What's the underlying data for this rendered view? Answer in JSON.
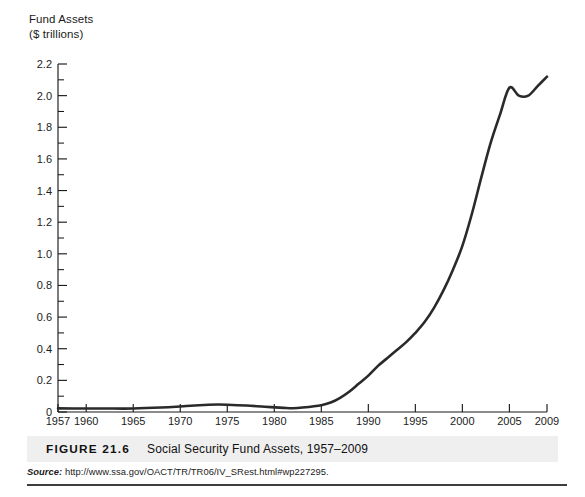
{
  "figure": {
    "number": "FIGURE 21.6",
    "title": "Social Security Fund Assets, 1957–2009",
    "source_label": "Source:",
    "source_url": "http://www.ssa.gov/OACT/TR/TR06/IV_SRest.html#wp227295."
  },
  "axis_title": "Fund Assets\n($ trillions)",
  "chart_data": {
    "type": "line",
    "title": "Social Security Fund Assets, 1957–2009",
    "xlabel": "",
    "ylabel": "Fund Assets ($ trillions)",
    "xlim": [
      1957,
      2009
    ],
    "ylim": [
      0,
      2.2
    ],
    "grid": false,
    "legend": "none",
    "x_tick_labels": [
      "1957",
      "1960",
      "1965",
      "1970",
      "1975",
      "1980",
      "1985",
      "1990",
      "1995",
      "2000",
      "2005",
      "2009"
    ],
    "x_ticks": [
      1957,
      1960,
      1965,
      1970,
      1975,
      1980,
      1985,
      1990,
      1995,
      2000,
      2005,
      2009
    ],
    "y_tick_labels": [
      "0",
      "0.2",
      "0.4",
      "0.6",
      "0.8",
      "1.0",
      "1.2",
      "1.4",
      "1.6",
      "1.8",
      "2.0",
      "2.2"
    ],
    "y_ticks": [
      0,
      0.2,
      0.4,
      0.6,
      0.8,
      1.0,
      1.2,
      1.4,
      1.6,
      1.8,
      2.0,
      2.2
    ],
    "y_minor_ticks": [
      0.1,
      0.3,
      0.5,
      0.7,
      0.9,
      1.1,
      1.3,
      1.5,
      1.7,
      1.9,
      2.1
    ],
    "series": [
      {
        "name": "Social Security Fund Assets",
        "color": "#2a2a2a",
        "x": [
          1957,
          1960,
          1962,
          1965,
          1968,
          1970,
          1972,
          1973,
          1974,
          1975,
          1977,
          1979,
          1981,
          1982,
          1983,
          1985,
          1986,
          1987,
          1988,
          1989,
          1990,
          1991,
          1992,
          1993,
          1994,
          1995,
          1996,
          1997,
          1998,
          1999,
          2000,
          2001,
          2002,
          2003,
          2004,
          2005,
          2006,
          2007,
          2008,
          2009
        ],
        "values": [
          0.023,
          0.022,
          0.022,
          0.022,
          0.028,
          0.035,
          0.043,
          0.046,
          0.047,
          0.046,
          0.041,
          0.033,
          0.026,
          0.024,
          0.028,
          0.043,
          0.06,
          0.09,
          0.13,
          0.18,
          0.23,
          0.29,
          0.34,
          0.39,
          0.44,
          0.5,
          0.57,
          0.66,
          0.77,
          0.9,
          1.05,
          1.25,
          1.48,
          1.7,
          1.88,
          2.05,
          2.0,
          2.0,
          2.06,
          2.12
        ]
      }
    ]
  }
}
